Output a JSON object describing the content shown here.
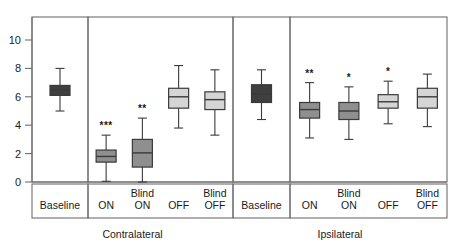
{
  "chart_data": {
    "type": "box",
    "title": "",
    "xlabel": "",
    "ylabel": "",
    "ylim": [
      0,
      11.6
    ],
    "yticks": [
      0,
      2,
      4,
      6,
      8,
      10
    ],
    "ytick_labels": [
      "0",
      "2",
      "4",
      "6",
      "8",
      "10"
    ],
    "grid": false,
    "legend": "none",
    "group_labels": [
      "Contralateral",
      "Ipsilateral"
    ],
    "panels": [
      {
        "name": "Contralateral Baseline",
        "group": "Contralateral",
        "categories": [
          "Baseline"
        ],
        "boxes": [
          {
            "label": "Baseline",
            "whisker_low": 5.0,
            "q1": 6.1,
            "median": 6.5,
            "q3": 6.8,
            "whisker_high": 8.0,
            "fill": "#3f3f3f",
            "significance": ""
          }
        ]
      },
      {
        "name": "Contralateral Conditions",
        "group": "Contralateral",
        "categories": [
          "ON",
          "Blind ON",
          "OFF",
          "Blind OFF"
        ],
        "boxes": [
          {
            "label": "ON",
            "whisker_low": 0.05,
            "q1": 1.4,
            "median": 1.8,
            "q3": 2.25,
            "whisker_high": 3.3,
            "fill": "#8f8f8f",
            "significance": "***"
          },
          {
            "label": "Blind ON",
            "whisker_low": 0.0,
            "q1": 1.05,
            "median": 2.05,
            "q3": 3.0,
            "whisker_high": 4.5,
            "fill": "#8f8f8f",
            "significance": "**"
          },
          {
            "label": "OFF",
            "whisker_low": 3.8,
            "q1": 5.2,
            "median": 6.0,
            "q3": 6.6,
            "whisker_high": 8.2,
            "fill": "#d5d5d5",
            "significance": ""
          },
          {
            "label": "Blind OFF",
            "whisker_low": 3.3,
            "q1": 5.1,
            "median": 5.8,
            "q3": 6.35,
            "whisker_high": 7.9,
            "fill": "#d5d5d5",
            "significance": ""
          }
        ]
      },
      {
        "name": "Ipsilateral Baseline",
        "group": "Ipsilateral",
        "categories": [
          "Baseline"
        ],
        "boxes": [
          {
            "label": "Baseline",
            "whisker_low": 4.4,
            "q1": 5.6,
            "median": 6.2,
            "q3": 6.85,
            "whisker_high": 7.9,
            "fill": "#3f3f3f",
            "significance": ""
          }
        ]
      },
      {
        "name": "Ipsilateral Conditions",
        "group": "Ipsilateral",
        "categories": [
          "ON",
          "Blind ON",
          "OFF",
          "Blind OFF"
        ],
        "boxes": [
          {
            "label": "ON",
            "whisker_low": 3.1,
            "q1": 4.5,
            "median": 5.1,
            "q3": 5.6,
            "whisker_high": 7.0,
            "fill": "#8f8f8f",
            "significance": "**"
          },
          {
            "label": "Blind ON",
            "whisker_low": 3.0,
            "q1": 4.4,
            "median": 5.0,
            "q3": 5.6,
            "whisker_high": 6.7,
            "fill": "#8f8f8f",
            "significance": "*"
          },
          {
            "label": "OFF",
            "whisker_low": 4.1,
            "q1": 5.2,
            "median": 5.65,
            "q3": 6.15,
            "whisker_high": 7.1,
            "fill": "#d5d5d5",
            "significance": "*"
          },
          {
            "label": "Blind OFF",
            "whisker_low": 3.9,
            "q1": 5.2,
            "median": 6.0,
            "q3": 6.6,
            "whisker_high": 7.6,
            "fill": "#d5d5d5",
            "significance": ""
          }
        ]
      }
    ],
    "colors": {
      "baseline_fill": "#3f3f3f",
      "on_fill": "#8f8f8f",
      "off_fill": "#d5d5d5",
      "stroke": "#3a3a3a",
      "frame": "#6e6e6e",
      "text": "#1a1a1a"
    }
  }
}
